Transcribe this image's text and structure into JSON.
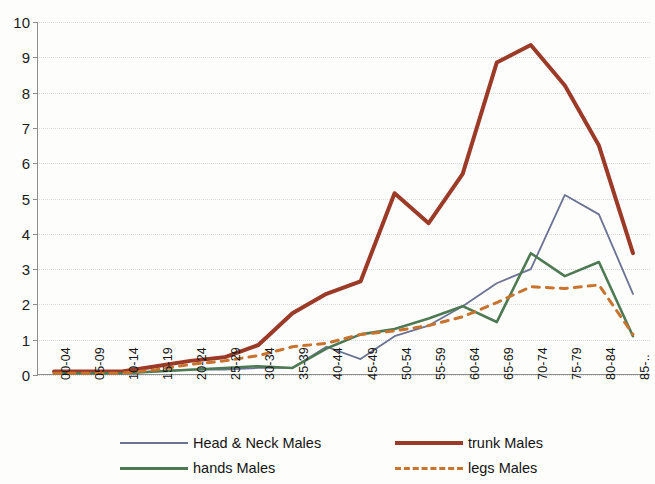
{
  "chart_data": {
    "type": "line",
    "title": "",
    "xlabel": "",
    "ylabel": "",
    "ylim": [
      0,
      10
    ],
    "ytick_step": 1,
    "grid": true,
    "legend_position": "bottom",
    "categories": [
      "00-04",
      "05-09",
      "10-14",
      "15-19",
      "20-24",
      "25-29",
      "30-34",
      "35-39",
      "40-44",
      "45-49",
      "50-54",
      "55-59",
      "60-64",
      "65-69",
      "70-74",
      "75-79",
      "80-84",
      "85-.."
    ],
    "yticks": [
      "0",
      "1",
      "2",
      "3",
      "4",
      "5",
      "6",
      "7",
      "8",
      "9",
      "10"
    ],
    "series": [
      {
        "name": "Head & Neck Males",
        "color": "#6b7394",
        "style": "solid",
        "width": 1.8,
        "values": [
          0.05,
          0.05,
          0.05,
          0.1,
          0.15,
          0.15,
          0.2,
          0.2,
          0.8,
          0.45,
          1.1,
          1.4,
          1.95,
          2.6,
          3.0,
          5.1,
          4.55,
          2.3
        ]
      },
      {
        "name": "trunk Males",
        "color": "#9c3a28",
        "style": "solid",
        "width": 4,
        "values": [
          0.1,
          0.1,
          0.1,
          0.25,
          0.4,
          0.5,
          0.85,
          1.75,
          2.3,
          2.65,
          5.15,
          4.3,
          5.7,
          8.85,
          9.35,
          8.2,
          6.5,
          3.45
        ]
      },
      {
        "name": "hands Males",
        "color": "#4e7a53",
        "style": "solid",
        "width": 2.6,
        "values": [
          0.05,
          0.05,
          0.05,
          0.1,
          0.15,
          0.2,
          0.25,
          0.2,
          0.75,
          1.15,
          1.3,
          1.6,
          1.95,
          1.5,
          3.45,
          2.8,
          3.2,
          1.1
        ]
      },
      {
        "name": "legs Males",
        "color": "#c8732e",
        "style": "dashed",
        "width": 3,
        "values": [
          0.05,
          0.05,
          0.05,
          0.15,
          0.3,
          0.4,
          0.55,
          0.8,
          0.9,
          1.15,
          1.25,
          1.4,
          1.65,
          2.05,
          2.5,
          2.45,
          2.55,
          1.15
        ]
      }
    ]
  },
  "legend": {
    "items": [
      {
        "label": "Head & Neck Males",
        "swatch": "sw-thin"
      },
      {
        "label": "trunk Males",
        "swatch": "sw-thick"
      },
      {
        "label": "hands Males",
        "swatch": "sw-green"
      },
      {
        "label": "legs Males",
        "swatch": "sw-dash"
      }
    ]
  }
}
